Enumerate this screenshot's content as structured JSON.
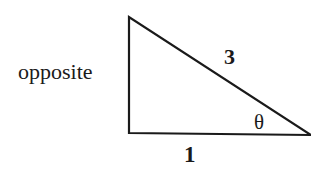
{
  "diagram": {
    "type": "right-triangle",
    "labels": {
      "opposite": "opposite",
      "hypotenuse": "3",
      "adjacent": "1",
      "angle": "θ"
    },
    "colors": {
      "stroke": "#1a1a1a",
      "background": "#ffffff"
    }
  }
}
